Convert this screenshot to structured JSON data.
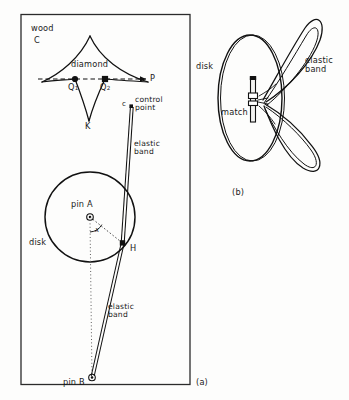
{
  "figure": {
    "panel_a": {
      "caption": "(a)",
      "labels": {
        "wood": "wood",
        "wood_point": "C",
        "diamond": "diamond",
        "point_q1": "Q",
        "point_q1_sub": "1",
        "point_q2": "Q",
        "point_q2_sub": "2",
        "point_p": "P",
        "cusp_k": "K",
        "control_marker": "c",
        "control_point": "control\npoint",
        "elastic_band_upper": "elastic\nband",
        "elastic_band_lower": "elastic\nband",
        "pin_a": "pin A",
        "angle_x": "x",
        "disk": "disk",
        "point_h": "H",
        "pin_b": "pin B"
      }
    },
    "panel_b": {
      "caption": "(b)",
      "labels": {
        "disk": "disk",
        "match": "match",
        "elastic_band": "elastic\nband"
      }
    },
    "colors": {
      "ink": "#1a1a1a",
      "paper": "#fdfdfc",
      "frame": "#2b2b2b"
    }
  }
}
